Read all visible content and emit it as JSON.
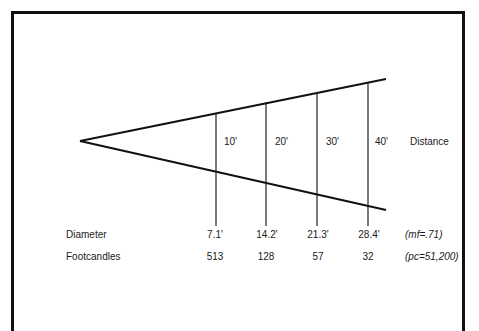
{
  "diagram": {
    "distance_label": "Distance",
    "distances": [
      "10'",
      "20'",
      "30'",
      "40'"
    ],
    "rows": {
      "diameter": {
        "label": "Diameter",
        "values": [
          "7.1'",
          "14.2'",
          "21.3'",
          "28.4'"
        ],
        "note": "(mf=.71)"
      },
      "footcandles": {
        "label": "Footcandles",
        "values": [
          "513",
          "128",
          "57",
          "32"
        ],
        "note": "(pc=51,200)"
      }
    },
    "colors": {
      "line": "#111111",
      "text": "#1a1a1a",
      "background": "#ffffff"
    }
  }
}
